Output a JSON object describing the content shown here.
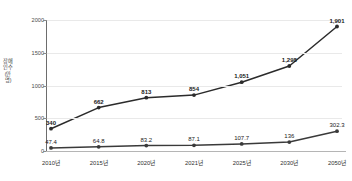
{
  "chart_data": {
    "type": "line",
    "title": "",
    "xlabel": "",
    "ylabel": "장애인수(만명)",
    "ylim": [
      0,
      2000
    ],
    "yticks": [
      0,
      500,
      1000,
      1500,
      2000
    ],
    "ytick_labels": [
      "0",
      "500",
      "1000",
      "1500",
      "2000"
    ],
    "grid": true,
    "legend": "none",
    "categories": [
      "2010년",
      "2015년",
      "2020년",
      "2021년",
      "2025년",
      "2030년",
      "2050년"
    ],
    "series": [
      {
        "name": "upper-series",
        "color": "#2b2b2b",
        "values": [
          340,
          662,
          813,
          854,
          1051,
          1298,
          1901
        ],
        "labels": [
          "340",
          "662",
          "813",
          "854",
          "1,051",
          "1,298",
          "1,901"
        ]
      },
      {
        "name": "lower-series",
        "color": "#3a3a3a",
        "values": [
          47.4,
          64.8,
          83.2,
          87.1,
          107.7,
          136,
          302.3
        ],
        "labels": [
          "47.4",
          "64.8",
          "83.2",
          "87.1",
          "107.7",
          "136",
          "302.3"
        ]
      }
    ]
  },
  "colors": {
    "line": "#2b2b2b",
    "grid": "#e9e9e9",
    "axis": "#6d6d6d",
    "baseline": "#b5b5b5",
    "background": "#ffffff",
    "text": "#1a1a1a"
  }
}
